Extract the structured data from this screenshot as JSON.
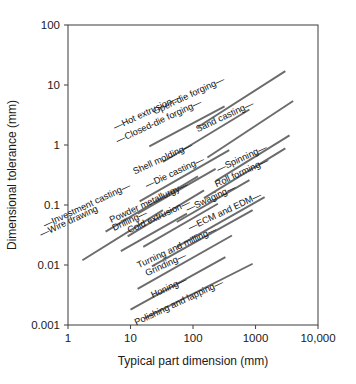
{
  "chart_data": {
    "type": "line",
    "title": "",
    "subtitle": "",
    "xlabel": "Typical part dimension (mm)",
    "ylabel": "Dimensional tolerance (mm)",
    "xscale": "log",
    "yscale": "log",
    "xlim": [
      1,
      10000
    ],
    "ylim": [
      0.001,
      100
    ],
    "grid": false,
    "legend": "none",
    "xticks": [
      "1",
      "10",
      "100",
      "1000",
      "10,000"
    ],
    "xtick_values": [
      1,
      10,
      100,
      1000,
      10000
    ],
    "yticks": [
      "100",
      "10",
      "1",
      "0.1",
      "0.01",
      "0.001"
    ],
    "ytick_values": [
      100,
      10,
      1,
      0.1,
      0.01,
      0.001
    ],
    "series": [
      {
        "name": "Hot extrusion",
        "label": "—Hot extrusion—",
        "x": [
          20,
          320
        ],
        "y": [
          0.95,
          4.4
        ],
        "label_x": 148,
        "label_y": 115,
        "label_angle": -25
      },
      {
        "name": "Open-die forging",
        "label": "Open-die forging—",
        "x": [
          120,
          3000
        ],
        "y": [
          2.0,
          17.0
        ],
        "label_x": 190,
        "label_y": 98,
        "label_angle": -25
      },
      {
        "name": "Closed-die forging",
        "label": "—Closed-die forging—",
        "x": [
          33,
          800
        ],
        "y": [
          0.52,
          3.9
        ],
        "label_x": 160,
        "label_y": 124,
        "label_angle": -25
      },
      {
        "name": "Sand casting",
        "label": "Sand casting—",
        "x": [
          170,
          4000
        ],
        "y": [
          0.62,
          5.4
        ],
        "label_x": 226,
        "label_y": 119,
        "label_angle": -25
      },
      {
        "name": "Shell molding",
        "label": "Shell molding—",
        "x": [
          14,
          380
        ],
        "y": [
          0.115,
          0.82
        ],
        "label_x": 164,
        "label_y": 161,
        "label_angle": -25
      },
      {
        "name": "Die casting",
        "label": "—Die casting—",
        "x": [
          13,
          230
        ],
        "y": [
          0.072,
          0.4
        ],
        "label_x": 176,
        "label_y": 175,
        "label_angle": -25
      },
      {
        "name": "Spinning",
        "label": "—Spinning—",
        "x": [
          230,
          3500
        ],
        "y": [
          0.25,
          1.45
        ],
        "label_x": 243,
        "label_y": 161,
        "label_angle": -25
      },
      {
        "name": "Roll forming",
        "label": "Roll forming—",
        "x": [
          150,
          3000
        ],
        "y": [
          0.13,
          0.88
        ],
        "label_x": 243,
        "label_y": 175,
        "label_angle": -25
      },
      {
        "name": "Investment casting",
        "label": "—Investment casting—",
        "x": [
          4.0,
          120
        ],
        "y": [
          0.036,
          0.3
        ],
        "label_x": 88,
        "label_y": 208,
        "label_angle": -25
      },
      {
        "name": "Powder metallurgy",
        "label": "Powder metallurgy—",
        "x": [
          9.0,
          150
        ],
        "y": [
          0.03,
          0.175
        ],
        "label_x": 150,
        "label_y": 205,
        "label_angle": -25
      },
      {
        "name": "Swaging",
        "label": "—Swaging—",
        "x": [
          55,
          800
        ],
        "y": [
          0.052,
          0.26
        ],
        "label_x": 212,
        "label_y": 201,
        "label_angle": -25
      },
      {
        "name": "Wire drawing",
        "label": "—Wire drawing",
        "x": [
          1.7,
          33
        ],
        "y": [
          0.012,
          0.082
        ],
        "label_x": 70,
        "label_y": 224,
        "label_angle": -25
      },
      {
        "name": "Drilling",
        "label": "Drilling—",
        "x": [
          7.0,
          80
        ],
        "y": [
          0.017,
          0.072
        ],
        "label_x": 131,
        "label_y": 223,
        "label_angle": -25
      },
      {
        "name": "Cold extrusion",
        "label": "Cold extrusion—",
        "x": [
          16,
          250
        ],
        "y": [
          0.02,
          0.105
        ],
        "label_x": 160,
        "label_y": 219,
        "label_angle": -25
      },
      {
        "name": "ECM and EDM",
        "label": "—ECM and EDM—",
        "x": [
          55,
          1400
        ],
        "y": [
          0.02,
          0.135
        ],
        "label_x": 226,
        "label_y": 214,
        "label_angle": -25
      },
      {
        "name": "Turning and milling",
        "label": "Turning and milling—",
        "x": [
          22,
          900
        ],
        "y": [
          0.0095,
          0.082
        ],
        "label_x": 178,
        "label_y": 250,
        "label_angle": -25
      },
      {
        "name": "Grinding",
        "label": "Grinding—",
        "x": [
          13,
          420
        ],
        "y": [
          0.004,
          0.031
        ],
        "label_x": 167,
        "label_y": 267,
        "label_angle": -25
      },
      {
        "name": "Honing",
        "label": "Honing—",
        "x": [
          10,
          330
        ],
        "y": [
          0.0018,
          0.0135
        ],
        "label_x": 170,
        "label_y": 290,
        "label_angle": -25
      },
      {
        "name": "Polishing and lapping",
        "label": "Polishing and lapping—",
        "x": [
          17,
          900
        ],
        "y": [
          0.0013,
          0.0105
        ],
        "label_x": 180,
        "label_y": 305,
        "label_angle": -25
      }
    ],
    "colors": {
      "line": "#6b6b6b",
      "axis": "#4d4d4d",
      "text": "#1a1a1a",
      "background": "#ffffff"
    }
  },
  "plot_geometry": {
    "left": 68,
    "right": 318,
    "top": 25,
    "bottom": 325
  }
}
